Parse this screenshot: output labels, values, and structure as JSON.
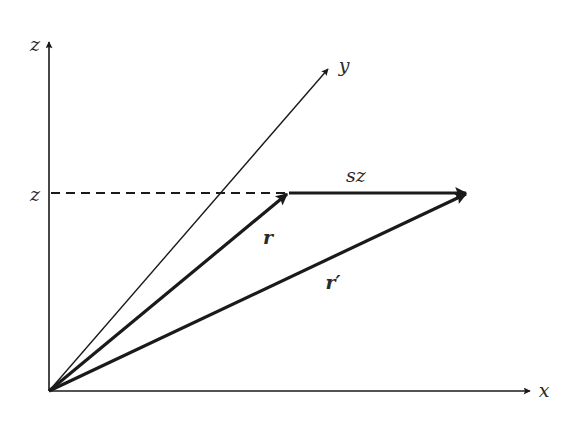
{
  "diagram": {
    "title": "",
    "colors": {
      "stroke": "#1a1a1a",
      "label": "#2a2a2a",
      "background": "#ffffff"
    },
    "axes": {
      "z": {
        "label": "z"
      },
      "x": {
        "label": "x"
      },
      "y": {
        "label": "y"
      }
    },
    "guide": {
      "tick_label": "z",
      "style": "dashed"
    },
    "vectors": {
      "r": {
        "label": "r"
      },
      "sz": {
        "label": "sz"
      },
      "r_prime": {
        "label": "r′"
      }
    }
  }
}
